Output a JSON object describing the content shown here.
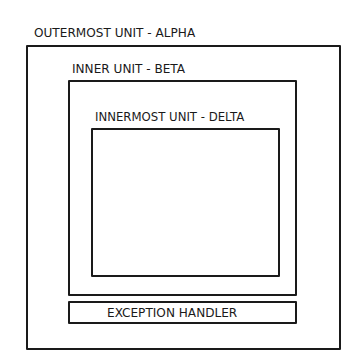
{
  "diagram": {
    "outer": {
      "label": "OUTERMOST UNIT - ALPHA"
    },
    "inner": {
      "label": "INNER UNIT - BETA"
    },
    "innermost": {
      "label": "INNERMOST UNIT - DELTA"
    },
    "exception_handler": {
      "label": "EXCEPTION HANDLER"
    }
  },
  "colors": {
    "stroke": "#1a1a1a",
    "background": "#ffffff"
  }
}
